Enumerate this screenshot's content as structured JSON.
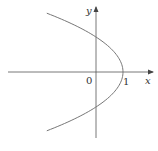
{
  "diagram": {
    "type": "parabola-graph",
    "equation": "x = 1 - y^2",
    "axes": {
      "x_label": "x",
      "y_label": "y",
      "origin_label": "0"
    },
    "ticks": {
      "x_intercept_label": "1"
    },
    "colors": {
      "curve": "#777777",
      "axis": "#555555",
      "text": "#333333"
    }
  }
}
